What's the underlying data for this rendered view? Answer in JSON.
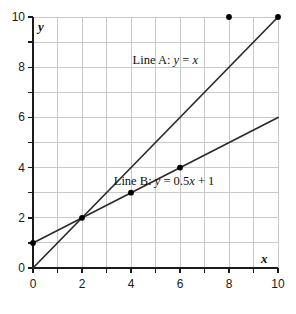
{
  "chart_data": {
    "type": "line",
    "title": "",
    "subtitle": "",
    "xlabel": "x",
    "ylabel": "y",
    "xlim": [
      0,
      10
    ],
    "ylim": [
      0,
      10
    ],
    "xticks": [
      0,
      2,
      4,
      6,
      8,
      10
    ],
    "yticks": [
      0,
      2,
      4,
      6,
      8,
      10
    ],
    "xtick_labels": [
      "0",
      "2",
      "4",
      "6",
      "8",
      "10"
    ],
    "ytick_labels": [
      "0",
      "2",
      "4",
      "6",
      "8",
      "10"
    ],
    "minor_tick_step": 1,
    "grid": true,
    "grid_step": 1,
    "grid_color": "#c9c9c9",
    "axis_color": "#1a1a1a",
    "line_color": "#2b2b2b",
    "marker_color": "#000000",
    "background": "#ffffff",
    "legend_position": "inline-annotations",
    "series": [
      {
        "name": "Line A",
        "label": "Line A: y = x",
        "label_prefix": "Line A: ",
        "equation_var": "y",
        "equation_rest": " = ",
        "equation_expr": "x",
        "formula": "y = x",
        "slope": 1,
        "intercept": 0,
        "x": [
          0,
          10
        ],
        "values": [
          0,
          10
        ],
        "markers": [
          {
            "x": 10,
            "y": 10
          }
        ],
        "label_x": 5.4,
        "label_y": 8.3
      },
      {
        "name": "Line B",
        "label": "Line B: y = 0.5x + 1",
        "label_prefix": "Line B: ",
        "equation_var": "y",
        "equation_rest": " = 0.5",
        "equation_expr": "x",
        "equation_tail": " + 1",
        "formula": "y = 0.5x + 1",
        "slope": 0.5,
        "intercept": 1,
        "x": [
          0,
          10
        ],
        "values": [
          1,
          6
        ],
        "markers": [
          {
            "x": 0,
            "y": 1
          },
          {
            "x": 2,
            "y": 2
          },
          {
            "x": 4,
            "y": 3
          },
          {
            "x": 6,
            "y": 4
          }
        ],
        "label_x": 5.35,
        "label_y": 3.45
      }
    ],
    "annotations": [
      {
        "name": "isolated-point",
        "type": "point",
        "x": 8,
        "y": 10
      }
    ],
    "intersection": {
      "x": 2,
      "y": 2
    }
  }
}
